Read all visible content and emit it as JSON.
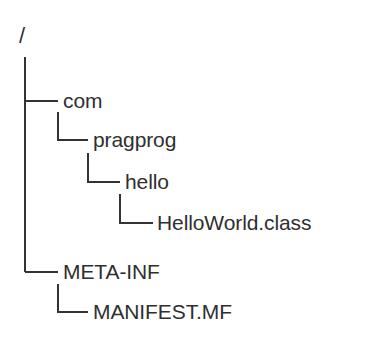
{
  "figure": {
    "name": "jar-directory-tree",
    "background_color": "#ffffff",
    "line_color": "#333333",
    "text_color": "#2f2f2f",
    "line_width": 2
  },
  "tree": {
    "root": {
      "label": "/",
      "depth": 0
    },
    "nodes": [
      {
        "label": "com",
        "depth": 1,
        "connector": "tee",
        "type": "directory"
      },
      {
        "label": "pragprog",
        "depth": 2,
        "connector": "elbow",
        "type": "directory"
      },
      {
        "label": "hello",
        "depth": 3,
        "connector": "elbow",
        "type": "directory"
      },
      {
        "label": "HelloWorld.class",
        "depth": 4,
        "connector": "elbow",
        "type": "file"
      },
      {
        "label": "META-INF",
        "depth": 1,
        "connector": "elbow",
        "type": "directory"
      },
      {
        "label": "MANIFEST.MF",
        "depth": 2,
        "connector": "elbow",
        "type": "file"
      }
    ]
  }
}
